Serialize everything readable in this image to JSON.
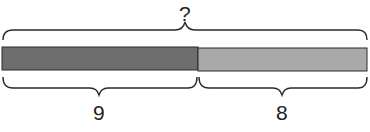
{
  "diagram": {
    "type": "tape-diagram",
    "total_label": "?",
    "parts": [
      {
        "label": "9",
        "color": "#6e6e6e"
      },
      {
        "label": "8",
        "color": "#a9a9a9"
      }
    ],
    "outline_color": "#2a2a2a"
  }
}
